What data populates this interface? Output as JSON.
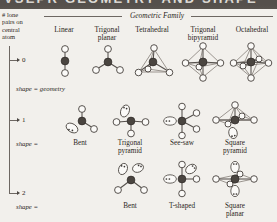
{
  "titlebar": {
    "text": "VSEPR GEOMETRY AND SHAPE"
  },
  "axis": {
    "label": "# lone pairs on central atom",
    "label_lines": [
      "# lone",
      "pairs on",
      "central",
      "atom"
    ],
    "ticks": [
      "0",
      "1",
      "2"
    ]
  },
  "family_header": {
    "title": "Geometric Family"
  },
  "columns": [
    {
      "key": "linear",
      "label": "Linear",
      "label_lines": [
        "Linear"
      ]
    },
    {
      "key": "trigonal-planar",
      "label": "Trigonal planar",
      "label_lines": [
        "Trigonal",
        "planar"
      ]
    },
    {
      "key": "tetrahedral",
      "label": "Tetrahedral",
      "label_lines": [
        "Tetrahedral"
      ]
    },
    {
      "key": "trigonal-bipyramid",
      "label": "Trigonal bipyramid",
      "label_lines": [
        "Trigonal",
        "bipyramid"
      ]
    },
    {
      "key": "octahedral",
      "label": "Octahedral",
      "label_lines": [
        "Octahedral"
      ]
    }
  ],
  "rows": [
    {
      "lone_pairs": "0",
      "shape_eq": "shape = geometry",
      "shapes": [
        "",
        "",
        "",
        "",
        ""
      ]
    },
    {
      "lone_pairs": "1",
      "shape_eq": "shape =",
      "shapes": [
        "",
        "Bent",
        "Trigonal pyramid",
        "See-saw",
        "Square pyramid"
      ],
      "shape_lines": [
        [],
        [
          "Bent"
        ],
        [
          "Trigonal",
          "pyramid"
        ],
        [
          "See-saw"
        ],
        [
          "Square",
          "pyramid"
        ]
      ]
    },
    {
      "lone_pairs": "2",
      "shape_eq": "shape =",
      "shapes": [
        "",
        "",
        "Bent",
        "T-shaped",
        "Square planar"
      ],
      "shape_lines": [
        [],
        [],
        [
          "Bent"
        ],
        [
          "T-shaped"
        ],
        [
          "Square",
          "planar"
        ]
      ]
    }
  ],
  "colors": {
    "page_background": "#f2f0ec",
    "ink": "#2b2622",
    "rule": "#6d6762",
    "central_atom": "#4a4540",
    "ligand_atom": "#fbfaf8",
    "titlebar": "#55504c"
  }
}
